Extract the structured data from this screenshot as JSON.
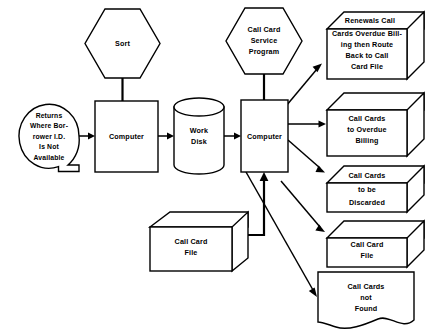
{
  "diagram": {
    "type": "flowchart",
    "background_color": "#ffffff",
    "line_color": "#000000",
    "nodes": {
      "sort": {
        "label": "Sort",
        "shape": "hexagon-preparation",
        "lines": [
          "Sort"
        ]
      },
      "returns": {
        "shape": "circle-connector-with-tail",
        "lines": [
          "Returns",
          "Where Bor-",
          "rower I.D.",
          "Is Not",
          "Available"
        ]
      },
      "computer_1": {
        "label": "Computer",
        "shape": "process-rectangle",
        "lines": [
          "Computer"
        ]
      },
      "work_disk": {
        "shape": "cylinder-disk-storage",
        "lines": [
          "Work",
          "Disk"
        ]
      },
      "service_program": {
        "shape": "hexagon-preparation",
        "lines": [
          "Call Card",
          "Service",
          "Program"
        ]
      },
      "computer_2": {
        "label": "Computer",
        "shape": "process-rectangle",
        "lines": [
          "Computer"
        ]
      },
      "call_card_file_input": {
        "shape": "box-3d-card-deck",
        "lines": [
          "Call Card",
          "File"
        ]
      },
      "renewals": {
        "shape": "box-3d-card-deck",
        "lines": [
          "Renewals Call",
          "Cards Overdue Bill-",
          "ing then Route",
          "Back to Call",
          "Card File"
        ]
      },
      "overdue_billing": {
        "shape": "box-3d-card-deck",
        "lines": [
          "Call Cards",
          "to Overdue",
          "Billing"
        ]
      },
      "discarded": {
        "shape": "box-3d-card-deck",
        "lines": [
          "Call Cards",
          "to be",
          "Discarded"
        ]
      },
      "call_card_file_output": {
        "shape": "box-3d-card-deck",
        "lines": [
          "Call Card",
          "File"
        ]
      },
      "not_found": {
        "shape": "document-wavy-bottom",
        "lines": [
          "Call Cards",
          "not",
          "Found"
        ]
      }
    },
    "edges": [
      {
        "from": "sort",
        "to": "computer_1",
        "style": "plain-line"
      },
      {
        "from": "returns",
        "to": "computer_1",
        "style": "arrow"
      },
      {
        "from": "computer_1",
        "to": "work_disk",
        "style": "arrow"
      },
      {
        "from": "work_disk",
        "to": "computer_2",
        "style": "arrow"
      },
      {
        "from": "service_program",
        "to": "computer_2",
        "style": "arrow"
      },
      {
        "from": "call_card_file_input",
        "to": "computer_2",
        "style": "elbow-arrow"
      },
      {
        "from": "computer_2",
        "to": "renewals",
        "style": "arrow"
      },
      {
        "from": "computer_2",
        "to": "overdue_billing",
        "style": "arrow"
      },
      {
        "from": "computer_2",
        "to": "discarded",
        "style": "arrow"
      },
      {
        "from": "computer_2",
        "to": "call_card_file_output",
        "style": "arrow"
      },
      {
        "from": "computer_2",
        "to": "not_found",
        "style": "arrow"
      }
    ]
  }
}
